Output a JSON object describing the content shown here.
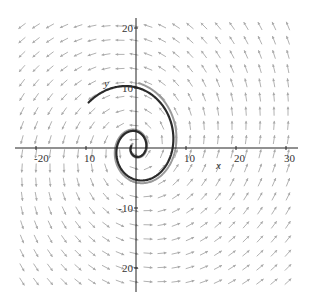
{
  "chart_data": {
    "type": "line",
    "title": "",
    "subtitle": "Direction field (phase portrait) with spiral solution trajectories",
    "xlabel": "x",
    "ylabel": "y",
    "xlim": [
      -25,
      32
    ],
    "ylim": [
      -24,
      22
    ],
    "grid": false,
    "x_ticks": [
      -20,
      -10,
      10,
      20,
      30
    ],
    "y_ticks": [
      20,
      10,
      -10,
      -20
    ],
    "x_tick_labels": [
      "-20",
      "-10",
      "10",
      "20",
      "30"
    ],
    "y_tick_labels": [
      "20",
      "10",
      "-10",
      "-20"
    ],
    "legend": [],
    "direction_field": {
      "description": "Counterclockwise rotating field with outward growth (unstable spiral at origin)",
      "spacing_units": {
        "x": 2.8,
        "y": 2.35
      },
      "arrow_color": "#a8a8a8"
    },
    "series": [
      {
        "name": "dark trajectory",
        "color": "#2a2a2a",
        "width": 2.2,
        "spiral": {
          "a": 2.02,
          "b": 0.205,
          "theta_start": -3.5,
          "theta_end": 8.75,
          "phase": 0.0
        }
      },
      {
        "name": "gray trajectory",
        "color": "#9a9a9a",
        "width": 2.0,
        "spiral": {
          "a": 2.3,
          "b": 0.205,
          "theta_start": -4.2,
          "theta_end": 7.55,
          "phase": 0.25
        }
      }
    ]
  },
  "axes": {
    "x_label": "x",
    "y_label": "y",
    "ticks_x": [
      {
        "value": -20,
        "label": "-20"
      },
      {
        "value": -10,
        "label": "10"
      },
      {
        "value": 10,
        "label": "10"
      },
      {
        "value": 20,
        "label": "20"
      },
      {
        "value": 30,
        "label": "30"
      }
    ],
    "ticks_y": [
      {
        "value": 20,
        "label": "20"
      },
      {
        "value": 10,
        "label": "10"
      },
      {
        "value": -10,
        "label": "-10"
      },
      {
        "value": -20,
        "label": "20"
      }
    ]
  },
  "colors": {
    "axis": "#222222",
    "arrows": "#a8a8a8",
    "background": "#ffffff"
  }
}
